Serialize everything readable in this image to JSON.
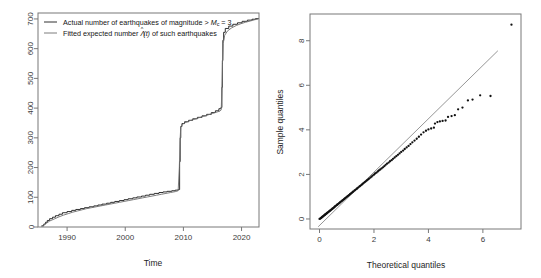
{
  "figure": {
    "background": "#ffffff",
    "width": 541,
    "height": 278,
    "panel_count": 2
  },
  "chart_data": [
    {
      "id": "cumulative-count-plot",
      "type": "line",
      "title": "",
      "xlabel": "Time",
      "ylabel": "",
      "xlim": [
        1985.0,
        2023.0
      ],
      "ylim": [
        0,
        720
      ],
      "xticks": [
        1990,
        2000,
        2010,
        2020
      ],
      "xtick_labels": [
        "1990",
        "2000",
        "2010",
        "2020"
      ],
      "yticks": [
        0,
        100,
        200,
        300,
        400,
        500,
        600,
        700
      ],
      "ytick_labels": [
        "0",
        "100",
        "200",
        "300",
        "400",
        "500",
        "600",
        "700"
      ],
      "grid": false,
      "legend_position": "top-left",
      "legend": [
        {
          "label_parts": [
            "Actual number of earthquakes of magnitude > ",
            "M",
            "c",
            " = 3"
          ],
          "label": "Actual number of earthquakes of magnitude > Mc = 3",
          "color": "#1a1a1a",
          "style": "solid",
          "series_key": "actual"
        },
        {
          "label_parts": [
            "Fitted expected number ",
            "Λ(t)",
            " of such earthquakes"
          ],
          "label": "Fitted expected number Λ̂(t) of such earthquakes",
          "color": "#6e6e6e",
          "style": "solid",
          "series_key": "fitted"
        }
      ],
      "series": [
        {
          "name": "Actual number of earthquakes of magnitude > Mc = 3",
          "color": "#1a1a1a",
          "step": true,
          "x": [
            1985.6,
            1986.0,
            1986.3,
            1986.6,
            1987.0,
            1987.5,
            1988.0,
            1988.6,
            1989.2,
            1990.0,
            1990.8,
            1991.5,
            1992.3,
            1993.0,
            1993.8,
            1994.6,
            1995.3,
            1996.0,
            1996.8,
            1997.5,
            1998.2,
            1999.0,
            1999.8,
            2000.5,
            2001.3,
            2002.0,
            2002.8,
            2003.5,
            2004.2,
            2005.0,
            2005.8,
            2006.5,
            2007.2,
            2008.0,
            2008.6,
            2009.1,
            2009.35,
            2009.45,
            2009.55,
            2009.75,
            2010.2,
            2010.9,
            2011.6,
            2012.4,
            2013.2,
            2014.0,
            2014.8,
            2015.5,
            2016.1,
            2016.45,
            2016.62,
            2016.7,
            2016.78,
            2016.92,
            2017.2,
            2017.8,
            2018.5,
            2019.3,
            2020.1,
            2021.0,
            2021.8,
            2022.4,
            2022.9
          ],
          "y": [
            4,
            10,
            16,
            22,
            28,
            33,
            38,
            43,
            48,
            52,
            56,
            59,
            62,
            65,
            68,
            71,
            74,
            77,
            80,
            83,
            86,
            89,
            92,
            95,
            98,
            101,
            104,
            107,
            110,
            113,
            116,
            118,
            120,
            122,
            124,
            126,
            220,
            300,
            338,
            348,
            354,
            359,
            364,
            369,
            374,
            379,
            385,
            391,
            398,
            402,
            470,
            560,
            628,
            655,
            668,
            676,
            682,
            687,
            692,
            696,
            699,
            701,
            702
          ]
        },
        {
          "name": "Fitted expected number Λ̂(t) of such earthquakes",
          "color": "#6e6e6e",
          "step": false,
          "x": [
            1985.6,
            1986.0,
            1986.5,
            1987.0,
            1987.8,
            1988.6,
            1989.4,
            1990.2,
            1991.0,
            1991.8,
            1992.6,
            1993.4,
            1994.2,
            1995.0,
            1995.8,
            1996.6,
            1997.4,
            1998.2,
            1999.0,
            1999.8,
            2000.6,
            2001.4,
            2002.2,
            2003.0,
            2003.8,
            2004.6,
            2005.4,
            2006.2,
            2007.0,
            2007.8,
            2008.6,
            2009.1,
            2009.3,
            2009.42,
            2009.55,
            2009.8,
            2010.3,
            2011.0,
            2011.8,
            2012.6,
            2013.4,
            2014.2,
            2015.0,
            2015.8,
            2016.3,
            2016.5,
            2016.62,
            2016.72,
            2016.85,
            2017.1,
            2017.6,
            2018.3,
            2019.1,
            2019.9,
            2020.7,
            2021.5,
            2022.2,
            2022.9
          ],
          "y": [
            2,
            7,
            13,
            20,
            27,
            34,
            40,
            45,
            50,
            54,
            58,
            62,
            65,
            68,
            71,
            74,
            77,
            80,
            83,
            86,
            89,
            92,
            95,
            98,
            101,
            104,
            107,
            110,
            113,
            116,
            119,
            122,
            200,
            290,
            336,
            345,
            351,
            357,
            362,
            367,
            372,
            377,
            382,
            387,
            390,
            394,
            460,
            550,
            618,
            645,
            660,
            670,
            678,
            684,
            689,
            693,
            697,
            700
          ]
        }
      ]
    },
    {
      "id": "qq-plot",
      "type": "scatter",
      "title": "",
      "xlabel": "Theoretical quantiles",
      "ylabel": "Sample quantiles",
      "xlim": [
        -0.35,
        7.4
      ],
      "ylim": [
        -0.45,
        9.2
      ],
      "xticks": [
        0,
        2,
        4,
        6
      ],
      "xtick_labels": [
        "0",
        "2",
        "4",
        "6"
      ],
      "yticks": [
        0,
        2,
        4,
        6,
        8
      ],
      "ytick_labels": [
        "0",
        "2",
        "4",
        "6",
        "8"
      ],
      "grid": false,
      "reference_line": {
        "x0": -0.05,
        "y0": -0.35,
        "x1": 6.55,
        "y1": 7.55,
        "color": "#8a8a8a"
      },
      "point_color": "#111111",
      "point_radius": 1.15,
      "points": [
        [
          0.0,
          0.0
        ],
        [
          0.03,
          0.02
        ],
        [
          0.05,
          0.04
        ],
        [
          0.07,
          0.06
        ],
        [
          0.09,
          0.08
        ],
        [
          0.11,
          0.1
        ],
        [
          0.13,
          0.12
        ],
        [
          0.15,
          0.14
        ],
        [
          0.17,
          0.16
        ],
        [
          0.19,
          0.18
        ],
        [
          0.21,
          0.2
        ],
        [
          0.23,
          0.22
        ],
        [
          0.25,
          0.24
        ],
        [
          0.27,
          0.26
        ],
        [
          0.29,
          0.28
        ],
        [
          0.31,
          0.3
        ],
        [
          0.34,
          0.32
        ],
        [
          0.36,
          0.35
        ],
        [
          0.38,
          0.37
        ],
        [
          0.41,
          0.39
        ],
        [
          0.43,
          0.42
        ],
        [
          0.46,
          0.44
        ],
        [
          0.48,
          0.47
        ],
        [
          0.51,
          0.49
        ],
        [
          0.53,
          0.52
        ],
        [
          0.56,
          0.55
        ],
        [
          0.58,
          0.57
        ],
        [
          0.61,
          0.6
        ],
        [
          0.64,
          0.63
        ],
        [
          0.66,
          0.65
        ],
        [
          0.69,
          0.68
        ],
        [
          0.72,
          0.71
        ],
        [
          0.75,
          0.74
        ],
        [
          0.78,
          0.77
        ],
        [
          0.81,
          0.8
        ],
        [
          0.84,
          0.83
        ],
        [
          0.87,
          0.86
        ],
        [
          0.9,
          0.89
        ],
        [
          0.93,
          0.92
        ],
        [
          0.96,
          0.95
        ],
        [
          0.99,
          0.98
        ],
        [
          1.02,
          1.01
        ],
        [
          1.05,
          1.04
        ],
        [
          1.08,
          1.07
        ],
        [
          1.12,
          1.11
        ],
        [
          1.15,
          1.14
        ],
        [
          1.18,
          1.17
        ],
        [
          1.22,
          1.21
        ],
        [
          1.25,
          1.24
        ],
        [
          1.29,
          1.28
        ],
        [
          1.32,
          1.31
        ],
        [
          1.36,
          1.35
        ],
        [
          1.39,
          1.38
        ],
        [
          1.43,
          1.42
        ],
        [
          1.47,
          1.46
        ],
        [
          1.5,
          1.49
        ],
        [
          1.54,
          1.53
        ],
        [
          1.58,
          1.57
        ],
        [
          1.62,
          1.61
        ],
        [
          1.66,
          1.65
        ],
        [
          1.7,
          1.69
        ],
        [
          1.74,
          1.73
        ],
        [
          1.78,
          1.77
        ],
        [
          1.82,
          1.81
        ],
        [
          1.87,
          1.86
        ],
        [
          1.91,
          1.9
        ],
        [
          1.95,
          1.95
        ],
        [
          2.0,
          1.99
        ],
        [
          2.04,
          2.04
        ],
        [
          2.09,
          2.08
        ],
        [
          2.14,
          2.13
        ],
        [
          2.18,
          2.18
        ],
        [
          2.23,
          2.22
        ],
        [
          2.28,
          2.27
        ],
        [
          2.33,
          2.32
        ],
        [
          2.38,
          2.37
        ],
        [
          2.43,
          2.43
        ],
        [
          2.48,
          2.48
        ],
        [
          2.54,
          2.53
        ],
        [
          2.59,
          2.59
        ],
        [
          2.65,
          2.64
        ],
        [
          2.7,
          2.7
        ],
        [
          2.76,
          2.76
        ],
        [
          2.82,
          2.82
        ],
        [
          2.88,
          2.88
        ],
        [
          2.94,
          2.94
        ],
        [
          3.0,
          3.01
        ],
        [
          3.07,
          3.07
        ],
        [
          3.13,
          3.14
        ],
        [
          3.2,
          3.21
        ],
        [
          3.27,
          3.28
        ],
        [
          3.34,
          3.36
        ],
        [
          3.41,
          3.44
        ],
        [
          3.49,
          3.52
        ],
        [
          3.57,
          3.6
        ],
        [
          3.65,
          3.69
        ],
        [
          3.73,
          3.79
        ],
        [
          3.82,
          3.89
        ],
        [
          3.91,
          3.96
        ],
        [
          4.0,
          4.02
        ],
        [
          4.1,
          4.06
        ],
        [
          4.2,
          4.1
        ],
        [
          4.24,
          4.28
        ],
        [
          4.33,
          4.35
        ],
        [
          4.42,
          4.38
        ],
        [
          4.52,
          4.4
        ],
        [
          4.63,
          4.42
        ],
        [
          4.72,
          4.58
        ],
        [
          4.85,
          4.62
        ],
        [
          4.97,
          4.66
        ],
        [
          5.09,
          4.92
        ],
        [
          5.25,
          5.0
        ],
        [
          5.45,
          5.32
        ],
        [
          5.62,
          5.36
        ],
        [
          5.9,
          5.55
        ],
        [
          6.28,
          5.52
        ],
        [
          7.05,
          8.72
        ]
      ]
    }
  ]
}
